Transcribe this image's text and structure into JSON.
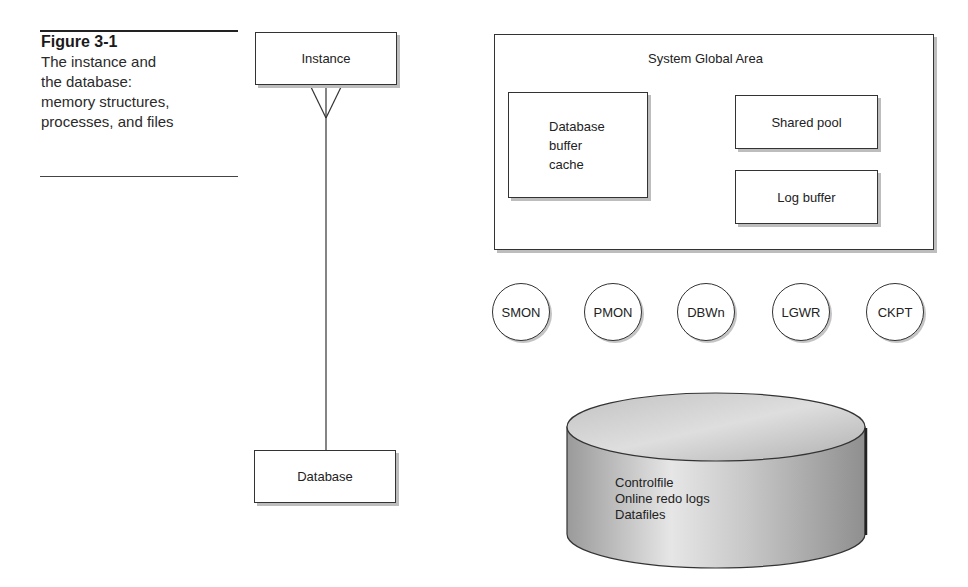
{
  "caption": {
    "figure_label": "Figure 3-1",
    "lines": [
      "The instance and",
      "the database:",
      "memory structures,",
      "processes, and files"
    ]
  },
  "er_diagram": {
    "top_entity": "Instance",
    "bottom_entity": "Database",
    "relationship": "one-to-many (crow's foot at Instance)"
  },
  "sga": {
    "title": "System Global Area",
    "components": [
      {
        "label_lines": [
          "Database",
          "buffer",
          "cache"
        ]
      },
      {
        "label_lines": [
          "Shared pool"
        ]
      },
      {
        "label_lines": [
          "Log buffer"
        ]
      }
    ]
  },
  "processes": [
    "SMON",
    "PMON",
    "DBWn",
    "LGWR",
    "CKPT"
  ],
  "database_storage": {
    "files": [
      "Controlfile",
      "Online redo logs",
      "Datafiles"
    ]
  },
  "colors": {
    "line": "#333333",
    "shadow": "#bdbdbd",
    "cylinder_fill": "#b8b8b8"
  }
}
